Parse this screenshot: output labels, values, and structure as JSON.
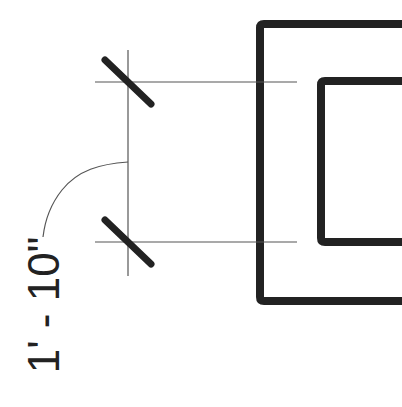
{
  "drawing": {
    "type": "architectural-detail",
    "dimension": {
      "label": "1' - 10\"",
      "orientation": "vertical",
      "text_rotation_deg": -90
    },
    "colors": {
      "background": "#ffffff",
      "heavy_line": "#222222",
      "thin_line": "#555555"
    }
  }
}
